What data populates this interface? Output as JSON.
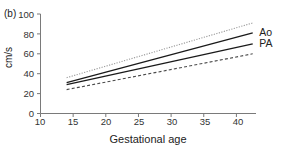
{
  "figure": {
    "panel_label": "(b)",
    "background": "#ffffff",
    "axis_color": "#7a7a7a"
  },
  "chart_data": {
    "type": "line",
    "title": "",
    "subtitle": "",
    "panel": "(b)",
    "xlabel": "Gestational age",
    "ylabel": "cm/s",
    "xlim": [
      10,
      43
    ],
    "ylim": [
      0,
      100
    ],
    "xticks": [
      10,
      15,
      20,
      25,
      30,
      35,
      40
    ],
    "xtick_labels": [
      "10",
      "15",
      "20",
      "25",
      "30",
      "35",
      "40"
    ],
    "yticks": [
      0,
      20,
      40,
      60,
      80,
      100
    ],
    "ytick_labels": [
      "0",
      "20",
      "40",
      "60",
      "80",
      "100"
    ],
    "grid": false,
    "legend_position": "right-inline",
    "x_data_range": [
      14,
      42.5
    ],
    "series": [
      {
        "name": "Ao upper limit",
        "annotation": "",
        "style": "dotted",
        "color": "#9a9a9a",
        "width": 1.1,
        "x": [
          14,
          42.5
        ],
        "values": [
          36,
          91
        ]
      },
      {
        "name": "Ao",
        "annotation": "Ao",
        "style": "solid",
        "color": "#1a1a1a",
        "width": 1.35,
        "x": [
          14,
          42.5
        ],
        "values": [
          31,
          81
        ]
      },
      {
        "name": "PA",
        "annotation": "PA",
        "style": "solid",
        "color": "#1a1a1a",
        "width": 1.35,
        "x": [
          14,
          42.5
        ],
        "values": [
          29,
          70
        ]
      },
      {
        "name": "PA lower limit",
        "annotation": "",
        "style": "dashed",
        "color": "#4a4a4a",
        "width": 1.1,
        "x": [
          14,
          42.5
        ],
        "values": [
          24,
          60
        ]
      }
    ],
    "annotations": [
      {
        "text": "Ao",
        "x": 43.2,
        "y": 81
      },
      {
        "text": "PA",
        "x": 43.2,
        "y": 70
      }
    ]
  }
}
